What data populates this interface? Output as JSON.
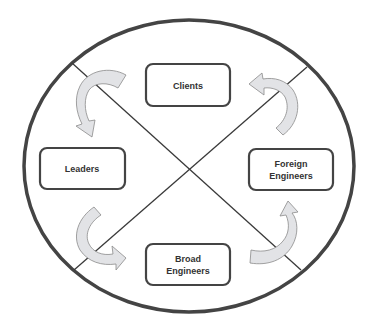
{
  "diagram": {
    "type": "cycle-quadrant",
    "colors": {
      "outline": "#444444",
      "divider": "#3a3a3a",
      "box_border": "#444444",
      "box_fill": "#ffffff",
      "arrow_fill": "#e2e3e6",
      "arrow_stroke": "#8a8a8a",
      "text": "#333333"
    },
    "nodes": [
      {
        "id": "clients",
        "lines": [
          "Clients"
        ]
      },
      {
        "id": "leaders",
        "lines": [
          "Leaders"
        ]
      },
      {
        "id": "foreign-engineers",
        "lines": [
          "Foreign",
          "Engineers"
        ]
      },
      {
        "id": "broad-engineers",
        "lines": [
          "Broad",
          "Engineers"
        ]
      }
    ],
    "arrows": [
      {
        "from": "clients",
        "to": "leaders",
        "icon": "curved-arrow-icon"
      },
      {
        "from": "leaders",
        "to": "broad-engineers",
        "icon": "curved-arrow-icon"
      },
      {
        "from": "broad-engineers",
        "to": "foreign-engineers",
        "icon": "curved-arrow-icon"
      },
      {
        "from": "foreign-engineers",
        "to": "clients",
        "icon": "curved-arrow-icon"
      }
    ]
  }
}
